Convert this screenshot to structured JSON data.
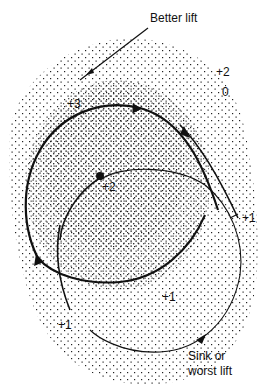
{
  "diagram": {
    "colors": {
      "ink": "#111111",
      "stipple": "#222222",
      "background": "#ffffff"
    },
    "annotations": {
      "better_lift": "Better lift",
      "sink_line1": "Sink or",
      "sink_line2": "worst lift"
    },
    "lift_values": [
      {
        "id": "top-right-plus2",
        "text": "+2"
      },
      {
        "id": "top-right-zero",
        "text": "0"
      },
      {
        "id": "core-plus3",
        "text": "+3"
      },
      {
        "id": "inner-plus2",
        "text": "+2"
      },
      {
        "id": "right-plus1",
        "text": "+1"
      },
      {
        "id": "bottom-mid-plus1",
        "text": "+1"
      },
      {
        "id": "bottom-left-plus1",
        "text": "+1"
      }
    ],
    "paths": [
      {
        "id": "original-circle",
        "description": "Heavy circle around the +3 core, entered from the right"
      },
      {
        "id": "shifted-circle",
        "description": "Thinner circle shifted toward sink side, passing the +2 point"
      }
    ]
  }
}
